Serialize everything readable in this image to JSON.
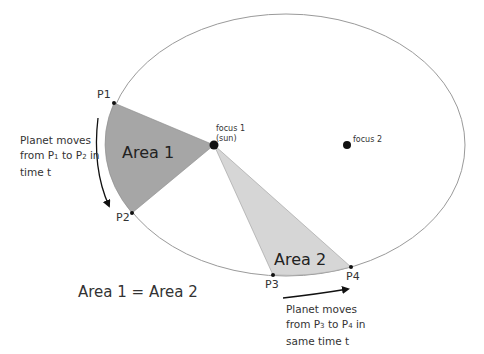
{
  "diagram": {
    "colors": {
      "orbit": "#9a9a9a",
      "area1_fill": "#a6a6a6",
      "area2_fill": "#d6d6d6",
      "point": "#111111",
      "text": "#333333"
    },
    "orbit": {
      "cx": 286,
      "cy": 145,
      "rx": 179,
      "ry": 131
    },
    "foci": [
      {
        "id": "focus1",
        "label_line1": "focus 1",
        "label_line2": "(sun)",
        "x": 214,
        "y": 145
      },
      {
        "id": "focus2",
        "label": "focus 2",
        "x": 347,
        "y": 145
      }
    ],
    "points": [
      {
        "id": "P1",
        "label": "P1",
        "x": 114,
        "y": 103
      },
      {
        "id": "P2",
        "label": "P2",
        "x": 132,
        "y": 213
      },
      {
        "id": "P3",
        "label": "P3",
        "x": 273,
        "y": 275
      },
      {
        "id": "P4",
        "label": "P4",
        "x": 351,
        "y": 267
      }
    ],
    "areas": [
      {
        "id": "area1",
        "label": "Area 1"
      },
      {
        "id": "area2",
        "label": "Area 2"
      }
    ],
    "annotations": {
      "move1": {
        "line1": "Planet moves",
        "line2_a": "from P",
        "line2_sub1": "1",
        "line2_b": " to P",
        "line2_sub2": "2",
        "line2_c": " in",
        "line3": "time t"
      },
      "move2": {
        "line1": "Planet moves",
        "line2_a": "from P",
        "line2_sub1": "3",
        "line2_b": " to P",
        "line2_sub2": "4",
        "line2_c": " in",
        "line3": "same time t"
      },
      "equation": "Area 1 = Area 2"
    }
  }
}
